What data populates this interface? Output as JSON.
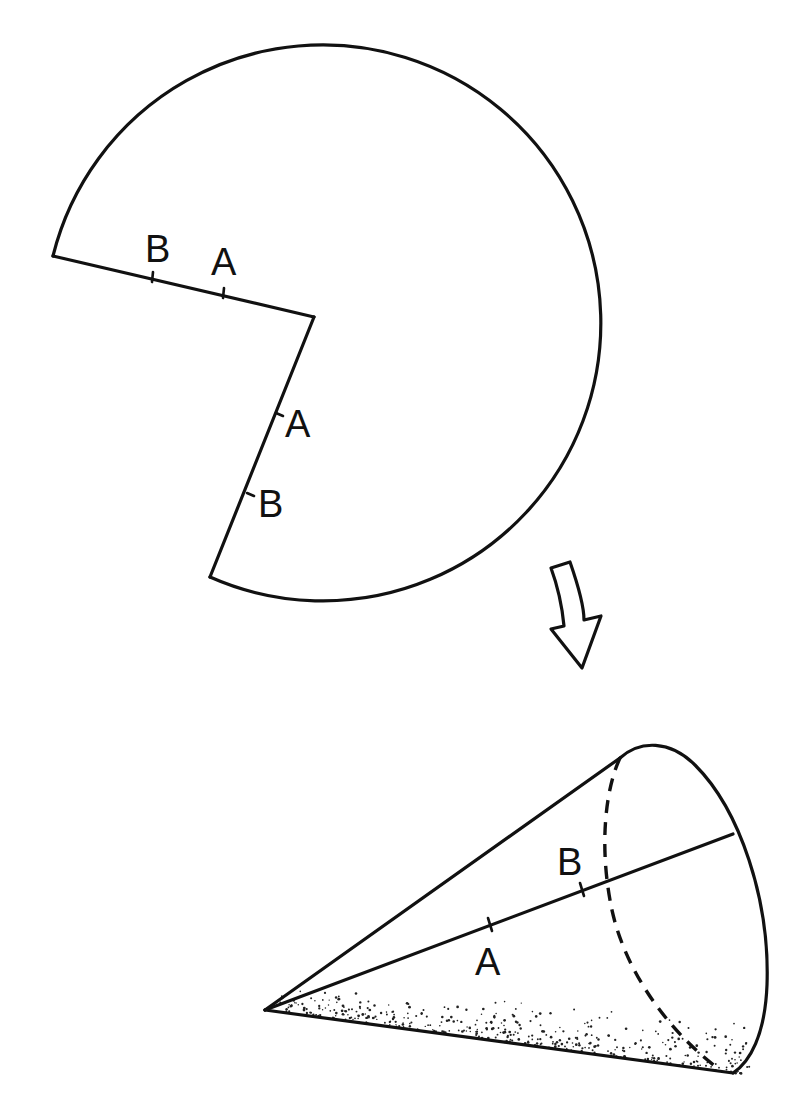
{
  "figure": {
    "stroke_color": "#111111",
    "background": "#ffffff"
  },
  "flat_sheet": {
    "labels": {
      "top_edge_b": "B",
      "top_edge_a": "A",
      "side_edge_a": "A",
      "side_edge_b": "B"
    }
  },
  "arrow": {
    "direction": "down",
    "meaning": "transform sheet into cone"
  },
  "cone": {
    "labels": {
      "seam_b": "B",
      "seam_a": "A"
    }
  }
}
